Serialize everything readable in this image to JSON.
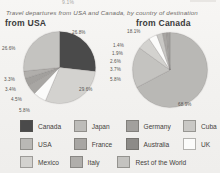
{
  "page": {
    "top_fragment": "9.1%",
    "subtitle": "Travel departures from USA and Canada, by country of destination"
  },
  "charts": {
    "usa": {
      "heading": "from USA",
      "labels": {
        "canada": "26.8%",
        "mexico": "29.6%",
        "uk": "5.8%",
        "france": "4.5%",
        "germany": "3.4%",
        "italy": "3.3%",
        "rest": "26.6%"
      }
    },
    "canada": {
      "heading": "from Canada",
      "labels": {
        "usa": "68.9%",
        "rest": "18.1%",
        "mexico": "5.8%",
        "uk": "3.7%",
        "cuba": "2.6%",
        "france": "1.9%",
        "germany": "1.4%"
      }
    }
  },
  "legend": {
    "rows": [
      [
        {
          "label": "Canada",
          "color": "#4a4a4a"
        },
        {
          "label": "Japan",
          "color": "#bdbcb9"
        },
        {
          "label": "Germany",
          "color": "#a2a09d"
        },
        {
          "label": "Cuba",
          "color": "#c9c8c5"
        }
      ],
      [
        {
          "label": "USA",
          "color": "#b9b8b5"
        },
        {
          "label": "France",
          "color": "#a8a6a3"
        },
        {
          "label": "Australia",
          "color": "#8d8b88"
        },
        {
          "label": "UK",
          "color": "#fbfbfa"
        }
      ],
      [
        {
          "label": "Mexico",
          "color": "#d3d2cf"
        },
        {
          "label": "Italy",
          "color": "#b0aeab"
        },
        {
          "label": "Rest of the World",
          "color": "#c4c3c0"
        }
      ]
    ]
  },
  "chart_data": [
    {
      "type": "pie",
      "title": "from USA",
      "subtitle": "Travel departures from USA and Canada, by country of destination",
      "unit": "percent",
      "categories": [
        "Canada",
        "Mexico",
        "UK",
        "France",
        "Germany",
        "Italy",
        "Rest of the World"
      ],
      "values": [
        26.8,
        29.6,
        5.8,
        4.5,
        3.4,
        3.3,
        26.6
      ],
      "colors": [
        "#4a4a4a",
        "#d3d2cf",
        "#fbfbfa",
        "#a8a6a3",
        "#a2a09d",
        "#b0aeab",
        "#c4c3c0"
      ],
      "legend": "bottom",
      "labels_shown": true
    },
    {
      "type": "pie",
      "title": "from Canada",
      "subtitle": "Travel departures from USA and Canada, by country of destination",
      "unit": "percent",
      "categories": [
        "USA",
        "Rest of the World",
        "Mexico",
        "UK",
        "Cuba",
        "France",
        "Germany"
      ],
      "values": [
        68.9,
        18.1,
        5.8,
        3.7,
        2.6,
        1.9,
        1.4
      ],
      "colors": [
        "#b9b8b5",
        "#c4c3c0",
        "#d3d2cf",
        "#fbfbfa",
        "#c9c8c5",
        "#a8a6a3",
        "#a2a09d"
      ],
      "legend": "bottom",
      "labels_shown": true
    }
  ]
}
